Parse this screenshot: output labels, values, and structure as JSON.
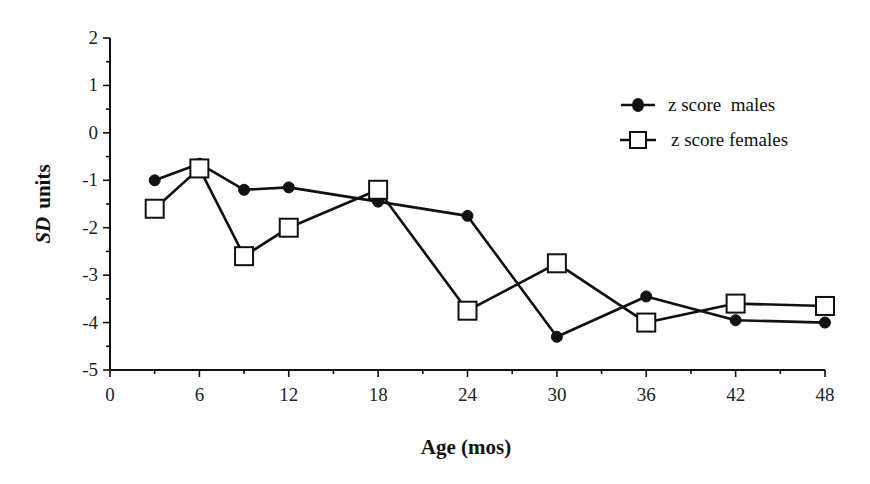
{
  "chart_data": {
    "type": "line",
    "title": "",
    "xlabel": "Age  (mos)",
    "ylabel_italic": "SD",
    "ylabel_rest": "units",
    "ylabel": "SD units",
    "xlim": [
      0,
      48
    ],
    "ylim": [
      -5,
      2
    ],
    "x_ticks": [
      0,
      6,
      12,
      18,
      24,
      30,
      36,
      42,
      48
    ],
    "x_minor_step": 3,
    "y_ticks": [
      2,
      1,
      0,
      -1,
      -2,
      -3,
      -4,
      -5
    ],
    "y_minor_step": 0.5,
    "grid": false,
    "legend_position": "upper right",
    "series": [
      {
        "name": "z score  males",
        "marker": "filled-circle",
        "color": "#111111",
        "x": [
          3,
          6,
          9,
          12,
          18,
          24,
          30,
          36,
          42,
          48
        ],
        "values": [
          -1.0,
          -0.65,
          -1.2,
          -1.15,
          -1.45,
          -1.75,
          -4.3,
          -3.45,
          -3.95,
          -4.0
        ]
      },
      {
        "name": "z score females",
        "marker": "open-square",
        "color": "#111111",
        "x": [
          3,
          6,
          9,
          12,
          18,
          24,
          30,
          36,
          42,
          48
        ],
        "values": [
          -1.6,
          -0.75,
          -2.6,
          -2.0,
          -1.2,
          -3.75,
          -2.75,
          -4.0,
          -3.6,
          -3.65
        ]
      }
    ]
  }
}
